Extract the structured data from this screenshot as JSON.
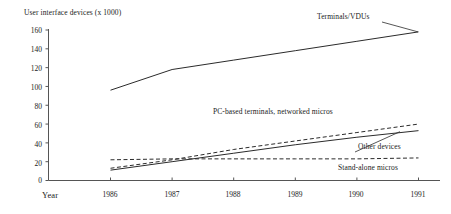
{
  "chart_data": {
    "type": "line",
    "title": "",
    "ylabel": "User interface devices (x 1000)",
    "xlabel": "Year",
    "x": [
      1986,
      1987,
      1988,
      1989,
      1990,
      1991
    ],
    "xtick_labels": [
      "1986",
      "1987",
      "1988",
      "1989",
      "1990",
      "1991"
    ],
    "ytick_labels": [
      "0",
      "20",
      "40",
      "60",
      "80",
      "100",
      "120",
      "140",
      "160"
    ],
    "ylim": [
      0,
      160
    ],
    "xlim": [
      1986,
      1991
    ],
    "grid": false,
    "legend": "inline-annotations",
    "series": [
      {
        "name": "Terminals/VDUs",
        "style": "solid",
        "values": [
          96,
          118,
          128,
          138,
          148,
          158
        ]
      },
      {
        "name": "PC-based terminals, networked micros",
        "style": "dashed",
        "values": [
          13,
          22,
          33,
          42,
          51,
          60
        ]
      },
      {
        "name": "Other devices",
        "style": "solid",
        "values": [
          11,
          20,
          29,
          38,
          46,
          53
        ]
      },
      {
        "name": "Stand-alone micros",
        "style": "dashed",
        "values": [
          22,
          23,
          23,
          23,
          23,
          24
        ]
      }
    ]
  },
  "annotations": [
    {
      "text": "Terminals/VDUs",
      "series": "Terminals/VDUs"
    },
    {
      "text": "PC-based terminals, networked micros",
      "series": "PC-based terminals, networked micros"
    },
    {
      "text": "Other devices",
      "series": "Other devices"
    },
    {
      "text": "Stand-alone micros",
      "series": "Stand-alone micros"
    }
  ],
  "colors": {
    "line": "#2b2b2b",
    "axis": "#555555",
    "text": "#1a1a1a",
    "background": "#ffffff"
  }
}
